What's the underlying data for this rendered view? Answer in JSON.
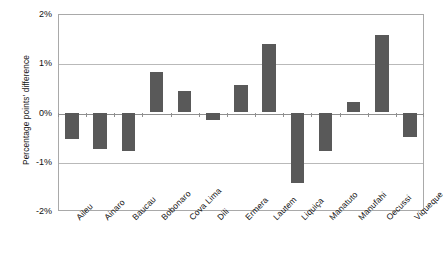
{
  "chart_data": {
    "type": "bar",
    "title": "",
    "subtitle": "",
    "xlabel": "",
    "ylabel": "Percentage points' difference",
    "categories": [
      "Aileu",
      "Ainaro",
      "Baucau",
      "Bobonaro",
      "Cova Lima",
      "Dili",
      "Ermera",
      "Lautem",
      "Liquiça",
      "Manatuto",
      "Manufahi",
      "Oecussi",
      "Viqueque"
    ],
    "values": [
      -0.53,
      -0.75,
      -0.78,
      0.82,
      0.43,
      -0.15,
      0.55,
      1.39,
      -1.43,
      -0.78,
      0.21,
      1.57,
      -0.5
    ],
    "ylim": [
      -2,
      2
    ],
    "ytick_values": [
      2,
      1,
      0,
      -1,
      -2
    ],
    "ytick_labels": [
      "2%",
      "1%",
      "0%",
      "-1%",
      "-2%"
    ],
    "grid": true,
    "legend": false,
    "legend_position": "none",
    "bar_color": "#595959",
    "grid_color": "#b9b9b9",
    "axis_color": "#a9a9a9"
  }
}
